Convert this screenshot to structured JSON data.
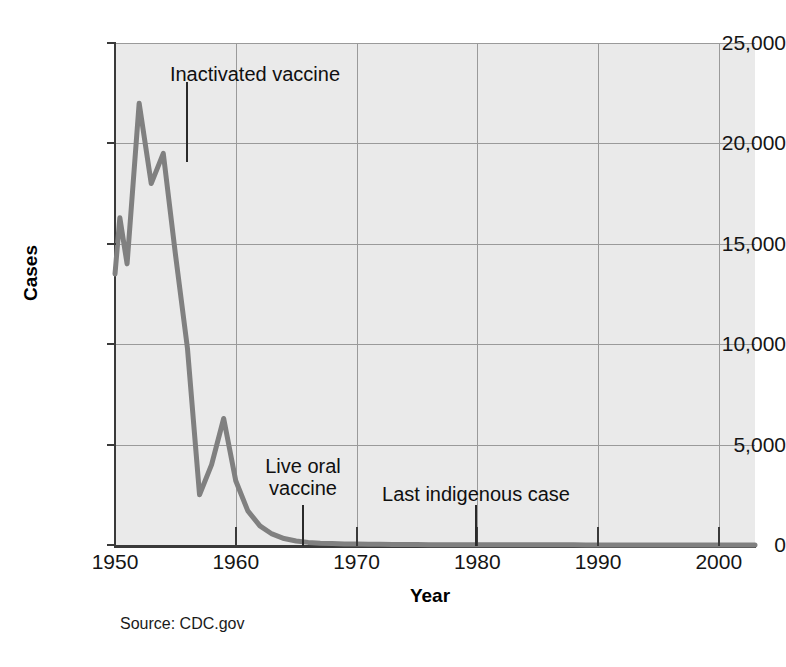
{
  "figure": {
    "source_note": "Source: CDC.gov",
    "line_color": "#808080",
    "plot_background": "#eaeaea",
    "grid_color": "#9a9a9a",
    "axis_color": "#3a3a3a"
  },
  "chart_data": {
    "type": "line",
    "title": "",
    "subtitle": "",
    "xlabel": "Year",
    "ylabel": "Cases",
    "xlim": [
      1950,
      2003
    ],
    "ylim": [
      0,
      25000
    ],
    "grid": true,
    "legend": "none",
    "x_ticks": [
      1950,
      1960,
      1970,
      1980,
      1990,
      2000
    ],
    "x_tick_labels": [
      "1950",
      "1960",
      "1970",
      "1980",
      "1990",
      "2000"
    ],
    "y_ticks": [
      0,
      5000,
      10000,
      15000,
      20000,
      25000
    ],
    "y_tick_labels": [
      "0",
      "5,000",
      "10,000",
      "15,000",
      "20,000",
      "25,000"
    ],
    "series": [
      {
        "name": "Polio cases",
        "color": "#808080",
        "x": [
          1950,
          1950.4,
          1951,
          1952,
          1953,
          1954,
          1955,
          1956,
          1957,
          1958,
          1959,
          1960,
          1961,
          1962,
          1963,
          1964,
          1965,
          1966,
          1967,
          1968,
          1969,
          1970,
          1971,
          1972,
          1973,
          1974,
          1975,
          1976,
          1977,
          1978,
          1979,
          1980,
          1981,
          1982,
          1983,
          1984,
          1985,
          1986,
          1987,
          1988,
          1989,
          1990,
          1991,
          1992,
          1993,
          1994,
          1995,
          1996,
          1997,
          1998,
          1999,
          2000,
          2001,
          2002,
          2003
        ],
        "values": [
          13500,
          16300,
          14000,
          22000,
          18000,
          19500,
          14500,
          9800,
          2500,
          4000,
          6300,
          3200,
          1700,
          950,
          550,
          320,
          200,
          130,
          90,
          70,
          55,
          45,
          38,
          32,
          28,
          24,
          21,
          18,
          16,
          14,
          13,
          12,
          11,
          10,
          9,
          9,
          8,
          8,
          7,
          7,
          6,
          6,
          6,
          5,
          5,
          5,
          4,
          4,
          4,
          3,
          3,
          3,
          2,
          2,
          2
        ]
      }
    ],
    "annotations": [
      {
        "text": "Inactivated vaccine",
        "label_x": 255,
        "label_y": 63,
        "leader_x": 186,
        "leader_y1": 82,
        "leader_y2": 162
      },
      {
        "text": "Live oral\nvaccine",
        "label_x": 303,
        "label_y": 455,
        "leader_x": 302,
        "leader_y1": 505,
        "leader_y2": 546
      },
      {
        "text": "Last indigenous case",
        "label_x": 476,
        "label_y": 483,
        "leader_x": 475,
        "leader_y1": 505,
        "leader_y2": 546
      }
    ]
  }
}
